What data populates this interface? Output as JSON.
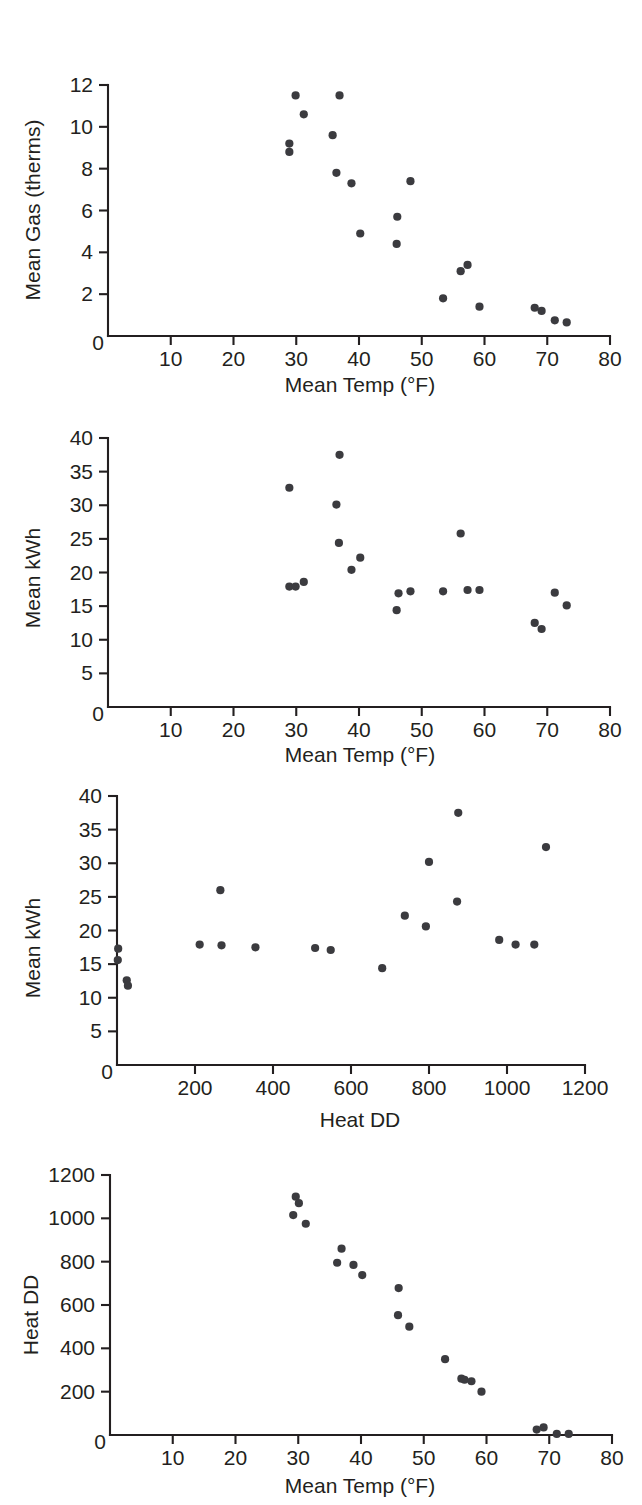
{
  "figure": {
    "type": "scatter-panel-figure",
    "panel_count": 4,
    "background": "#ffffff",
    "marker_color": "#3b3b3f",
    "axis_color": "#231f20"
  },
  "chart_data": [
    {
      "id": "panel-a-gas-vs-temp",
      "type": "scatter",
      "title": "",
      "xlabel": "Mean Temp (°F)",
      "ylabel": "Mean Gas (therms)",
      "xlim": [
        0,
        80
      ],
      "ylim": [
        0,
        12
      ],
      "xticks": [
        0,
        10,
        20,
        30,
        40,
        50,
        60,
        70,
        80
      ],
      "xticklabels": [
        "0",
        "10",
        "20",
        "30",
        "40",
        "50",
        "60",
        "70",
        "80"
      ],
      "yticks": [
        0,
        2,
        4,
        6,
        8,
        10,
        12
      ],
      "yticklabels": [
        "0",
        "2",
        "4",
        "6",
        "8",
        "10",
        "12"
      ],
      "grid": false,
      "legend": "none",
      "points": [
        {
          "x": 28.9,
          "y": 9.2
        },
        {
          "x": 28.9,
          "y": 8.8
        },
        {
          "x": 29.9,
          "y": 11.5
        },
        {
          "x": 31.2,
          "y": 10.6
        },
        {
          "x": 35.8,
          "y": 9.6
        },
        {
          "x": 36.9,
          "y": 11.5
        },
        {
          "x": 36.4,
          "y": 7.8
        },
        {
          "x": 38.8,
          "y": 7.3
        },
        {
          "x": 40.2,
          "y": 4.9
        },
        {
          "x": 46.1,
          "y": 5.7
        },
        {
          "x": 46.0,
          "y": 4.4
        },
        {
          "x": 48.2,
          "y": 7.4
        },
        {
          "x": 53.4,
          "y": 1.8
        },
        {
          "x": 56.2,
          "y": 3.1
        },
        {
          "x": 57.3,
          "y": 3.4
        },
        {
          "x": 59.2,
          "y": 1.4
        },
        {
          "x": 68.0,
          "y": 1.35
        },
        {
          "x": 69.1,
          "y": 1.2
        },
        {
          "x": 71.2,
          "y": 0.75
        },
        {
          "x": 73.1,
          "y": 0.65
        }
      ]
    },
    {
      "id": "panel-b-kwh-vs-temp",
      "type": "scatter",
      "title": "",
      "xlabel": "Mean Temp (°F)",
      "ylabel": "Mean kWh",
      "xlim": [
        0,
        80
      ],
      "ylim": [
        0,
        40
      ],
      "xticks": [
        0,
        10,
        20,
        30,
        40,
        50,
        60,
        70,
        80
      ],
      "xticklabels": [
        "0",
        "10",
        "20",
        "30",
        "40",
        "50",
        "60",
        "70",
        "80"
      ],
      "yticks": [
        0,
        5,
        10,
        15,
        20,
        25,
        30,
        35,
        40
      ],
      "yticklabels": [
        "0",
        "5",
        "10",
        "15",
        "20",
        "25",
        "30",
        "35",
        "40"
      ],
      "grid": false,
      "legend": "none",
      "points": [
        {
          "x": 28.9,
          "y": 32.6
        },
        {
          "x": 28.9,
          "y": 17.9
        },
        {
          "x": 29.9,
          "y": 17.9
        },
        {
          "x": 31.2,
          "y": 18.6
        },
        {
          "x": 36.4,
          "y": 30.1
        },
        {
          "x": 36.9,
          "y": 37.5
        },
        {
          "x": 36.8,
          "y": 24.4
        },
        {
          "x": 38.8,
          "y": 20.4
        },
        {
          "x": 40.2,
          "y": 22.2
        },
        {
          "x": 46.0,
          "y": 14.4
        },
        {
          "x": 46.3,
          "y": 16.9
        },
        {
          "x": 48.2,
          "y": 17.2
        },
        {
          "x": 53.4,
          "y": 17.2
        },
        {
          "x": 56.2,
          "y": 25.8
        },
        {
          "x": 57.3,
          "y": 17.4
        },
        {
          "x": 59.2,
          "y": 17.4
        },
        {
          "x": 68.0,
          "y": 12.5
        },
        {
          "x": 69.1,
          "y": 11.6
        },
        {
          "x": 71.2,
          "y": 17.0
        },
        {
          "x": 73.1,
          "y": 15.1
        }
      ]
    },
    {
      "id": "panel-c-kwh-vs-heatdd",
      "type": "scatter",
      "title": "",
      "xlabel": "Heat DD",
      "ylabel": "Mean kWh",
      "xlim": [
        0,
        1200
      ],
      "ylim": [
        0,
        40
      ],
      "xticks": [
        0,
        200,
        400,
        600,
        800,
        1000,
        1200
      ],
      "xticklabels": [
        "0",
        "200",
        "400",
        "600",
        "800",
        "1000",
        "1200"
      ],
      "yticks": [
        0,
        5,
        10,
        15,
        20,
        25,
        30,
        35,
        40
      ],
      "yticklabels": [
        "0",
        "5",
        "10",
        "15",
        "20",
        "25",
        "30",
        "35",
        "40"
      ],
      "grid": false,
      "legend": "none",
      "points": [
        {
          "x": 3,
          "y": 17.3
        },
        {
          "x": 2,
          "y": 15.6
        },
        {
          "x": 25,
          "y": 12.6
        },
        {
          "x": 28,
          "y": 11.8
        },
        {
          "x": 212,
          "y": 17.9
        },
        {
          "x": 265,
          "y": 26.0
        },
        {
          "x": 268,
          "y": 17.8
        },
        {
          "x": 355,
          "y": 17.5
        },
        {
          "x": 508,
          "y": 17.4
        },
        {
          "x": 548,
          "y": 17.1
        },
        {
          "x": 680,
          "y": 14.4
        },
        {
          "x": 738,
          "y": 22.2
        },
        {
          "x": 792,
          "y": 20.6
        },
        {
          "x": 800,
          "y": 30.2
        },
        {
          "x": 872,
          "y": 24.3
        },
        {
          "x": 875,
          "y": 37.5
        },
        {
          "x": 980,
          "y": 18.6
        },
        {
          "x": 1022,
          "y": 17.9
        },
        {
          "x": 1070,
          "y": 17.9
        },
        {
          "x": 1100,
          "y": 32.4
        }
      ]
    },
    {
      "id": "panel-d-heatdd-vs-temp",
      "type": "scatter",
      "title": "",
      "xlabel": "Mean Temp (°F)",
      "ylabel": "Heat DD",
      "xlim": [
        0,
        80
      ],
      "ylim": [
        0,
        1200
      ],
      "xticks": [
        0,
        10,
        20,
        30,
        40,
        50,
        60,
        70,
        80
      ],
      "xticklabels": [
        "0",
        "10",
        "20",
        "30",
        "40",
        "50",
        "60",
        "70",
        "80"
      ],
      "yticks": [
        0,
        200,
        400,
        600,
        800,
        1000,
        1200
      ],
      "yticklabels": [
        "0",
        "200",
        "400",
        "600",
        "800",
        "1000",
        "1200"
      ],
      "grid": false,
      "legend": "none",
      "points": [
        {
          "x": 29.2,
          "y": 1015
        },
        {
          "x": 29.6,
          "y": 1100
        },
        {
          "x": 30.1,
          "y": 1070
        },
        {
          "x": 31.2,
          "y": 975
        },
        {
          "x": 36.2,
          "y": 795
        },
        {
          "x": 36.9,
          "y": 860
        },
        {
          "x": 38.8,
          "y": 785
        },
        {
          "x": 40.2,
          "y": 738
        },
        {
          "x": 46.0,
          "y": 678
        },
        {
          "x": 45.9,
          "y": 553
        },
        {
          "x": 47.7,
          "y": 500
        },
        {
          "x": 53.4,
          "y": 350
        },
        {
          "x": 56.0,
          "y": 260
        },
        {
          "x": 56.5,
          "y": 255
        },
        {
          "x": 57.6,
          "y": 248
        },
        {
          "x": 59.2,
          "y": 200
        },
        {
          "x": 68.0,
          "y": 25
        },
        {
          "x": 69.1,
          "y": 35
        },
        {
          "x": 71.2,
          "y": 5
        },
        {
          "x": 73.1,
          "y": 5
        }
      ]
    }
  ]
}
